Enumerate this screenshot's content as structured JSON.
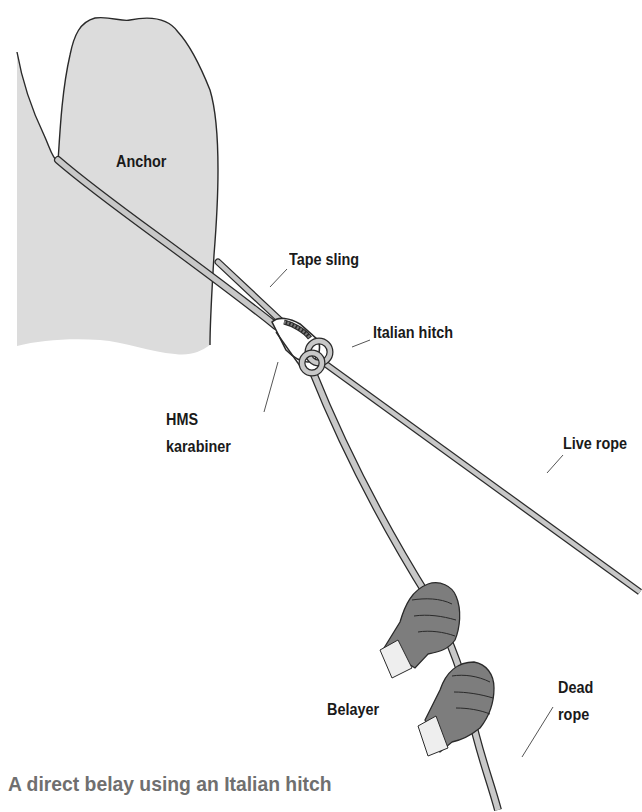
{
  "figure": {
    "caption": "A direct belay using an Italian hitch",
    "labels": {
      "anchor": "Anchor",
      "tape_sling": "Tape sling",
      "italian_hitch": "Italian hitch",
      "hms_line1": "HMS",
      "hms_line2": "karabiner",
      "live_rope": "Live rope",
      "belayer": "Belayer",
      "dead_rope_line1": "Dead",
      "dead_rope_line2": "rope"
    },
    "colors": {
      "rock_fill": "#dcdcdc",
      "rope_fill": "#c8c8c8",
      "outline": "#2a2a2a",
      "glove_fill": "#7d7d7d",
      "leader_line": "#555555",
      "caption_text": "#6f6f6f"
    }
  }
}
